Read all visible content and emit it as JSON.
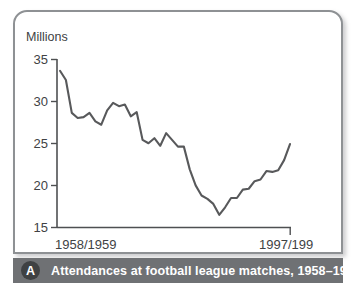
{
  "caption": {
    "badge": "A",
    "text": "Attendances at football league matches, 1958–1998"
  },
  "chart_data": {
    "type": "line",
    "title": "",
    "ylabel": "Millions",
    "xlabel": "",
    "ylim": [
      15,
      35
    ],
    "yticks": [
      15,
      20,
      25,
      30,
      35
    ],
    "ytick_labels": [
      "15",
      "20",
      "25",
      "30",
      "35"
    ],
    "xtick_labels": [
      "1958/1959",
      "1997/199"
    ],
    "grid": false,
    "legend": "none",
    "line_color": "#58595b",
    "axis_color": "#4e5052",
    "x": [
      "1958/1959",
      "1959/1960",
      "1960/1961",
      "1961/1962",
      "1962/1963",
      "1963/1964",
      "1964/1965",
      "1965/1966",
      "1966/1967",
      "1967/1968",
      "1968/1969",
      "1969/1970",
      "1970/1971",
      "1971/1972",
      "1972/1973",
      "1973/1974",
      "1974/1975",
      "1975/1976",
      "1976/1977",
      "1977/1978",
      "1978/1979",
      "1979/1980",
      "1980/1981",
      "1981/1982",
      "1982/1983",
      "1983/1984",
      "1984/1985",
      "1985/1986",
      "1986/1987",
      "1987/1988",
      "1988/1989",
      "1989/1990",
      "1990/1991",
      "1991/1992",
      "1992/1993",
      "1993/1994",
      "1994/1995",
      "1995/1996",
      "1996/1997",
      "1997/1998"
    ],
    "values": [
      33.6,
      32.5,
      28.6,
      28.0,
      28.1,
      28.6,
      27.6,
      27.2,
      28.9,
      29.8,
      29.4,
      29.6,
      28.2,
      28.7,
      25.4,
      25.0,
      25.6,
      24.7,
      26.2,
      25.4,
      24.6,
      24.6,
      21.9,
      20.0,
      18.8,
      18.4,
      17.8,
      16.5,
      17.4,
      18.5,
      18.5,
      19.5,
      19.6,
      20.5,
      20.7,
      21.7,
      21.6,
      21.8,
      23.0,
      24.9
    ]
  }
}
